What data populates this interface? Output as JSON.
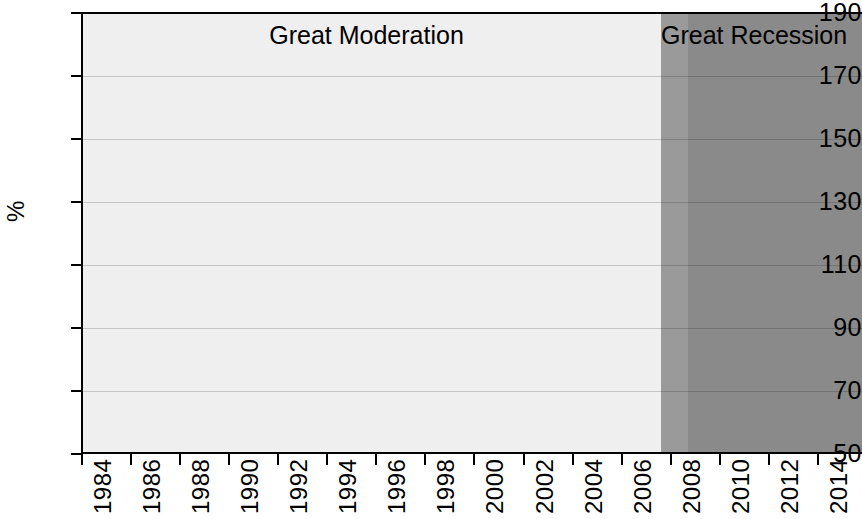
{
  "chart_data": {
    "type": "line",
    "title": "",
    "xlabel": "",
    "ylabel": "%",
    "xlim": [
      1984,
      2015.8
    ],
    "ylim": [
      50,
      190
    ],
    "ytick_step": 20,
    "xtick_step": 2,
    "grid": true,
    "legend_position": "none",
    "yticks": [
      190,
      170,
      150,
      130,
      110,
      90,
      70,
      50
    ],
    "xticks": [
      1984,
      1986,
      1988,
      1990,
      1992,
      1994,
      1996,
      1998,
      2000,
      2002,
      2004,
      2006,
      2008,
      2010,
      2012,
      2014
    ],
    "series": [
      {
        "name": "ratio",
        "color": "#111111",
        "x": [
          1984,
          1985,
          1986,
          1987,
          1988,
          1989,
          1990,
          1991,
          1992,
          1993,
          1994,
          1995,
          1996,
          1997,
          1998,
          1999,
          2000,
          2001,
          2002,
          2003,
          2004,
          2005,
          2006,
          2007,
          2008,
          2009,
          2010,
          2011,
          2012,
          2013,
          2014,
          2015.8
        ],
        "values": [
          54,
          58,
          62,
          67,
          72,
          77,
          76.5,
          76.5,
          77,
          78,
          79,
          80,
          82,
          85,
          90,
          96,
          103,
          110,
          118,
          129,
          146,
          180,
          184,
          166,
          152,
          147,
          141,
          135,
          141,
          158,
          168,
          176
        ]
      }
    ],
    "annotations": [
      {
        "id": "great-moderation",
        "label": "Great Moderation",
        "x_center": 1995.6,
        "y": 183,
        "region_start": 1984,
        "region_end": 2007.6,
        "region_color": "#efefef"
      },
      {
        "id": "great-recession-light",
        "label": "",
        "region_start": 2007.6,
        "region_end": 2008.7,
        "region_color": "#9a9a9a"
      },
      {
        "id": "great-recession",
        "label": "Great Recession",
        "x_center": 2011.4,
        "y": 183,
        "region_start": 2008.7,
        "region_end": 2015.8,
        "region_color": "#8a8a8a"
      }
    ]
  },
  "axes": {
    "y_axis_label": "%",
    "y_tick_labels": [
      "190",
      "170",
      "150",
      "130",
      "110",
      "90",
      "70",
      "50"
    ],
    "x_tick_labels": [
      "1984",
      "1986",
      "1988",
      "1990",
      "1992",
      "1994",
      "1996",
      "1998",
      "2000",
      "2002",
      "2004",
      "2006",
      "2008",
      "2010",
      "2012",
      "2014"
    ]
  },
  "regions": {
    "moderation_label": "Great Moderation",
    "recession_label": "Great Recession"
  },
  "colors": {
    "line": "#111111",
    "plot_light": "#efefef",
    "plot_mid_gray": "#9a9a9a",
    "plot_dark_gray": "#8a8a8a",
    "axis": "#000000",
    "grid": "#c9c9c9"
  }
}
